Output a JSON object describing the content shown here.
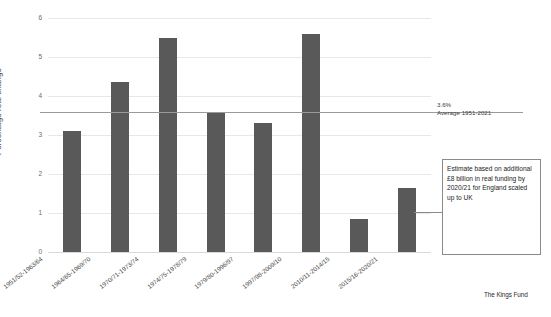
{
  "chart_data": {
    "type": "bar",
    "title": "",
    "xlabel": "",
    "ylabel": "Percentage real change",
    "ylim": [
      0,
      6
    ],
    "yticks": [
      0,
      1,
      2,
      3,
      4,
      5,
      6
    ],
    "ytick_labels": [
      "0",
      "1",
      "2",
      "3",
      "4",
      "5",
      "6"
    ],
    "grid": true,
    "legend": "none",
    "bar_color": "#595959",
    "categories": [
      "1951/52-1963/64",
      "1964/65-1969/70",
      "1970/71-1973/74",
      "1974/75-1978/79",
      "1979/80-1996/97",
      "1997/98-2009/10",
      "2010/11-2014/15",
      "2015/16-2020/21"
    ],
    "values": [
      3.1,
      4.35,
      5.5,
      3.6,
      3.3,
      5.6,
      0.85,
      1.65
    ],
    "reference_line": {
      "value": 3.6,
      "label_value": "3.6%",
      "label_caption": "Average 1951-2021",
      "color": "#9a9a9a"
    },
    "annotations": [
      {
        "target_category": "2015/16-2020/21",
        "text": "Estimate based on additional £8 billion in real funding by 2020/21 for England scaled up to UK"
      }
    ]
  },
  "axis": {
    "y_title": "Percentage real change"
  },
  "credit": {
    "text": "The Kings Fund"
  }
}
